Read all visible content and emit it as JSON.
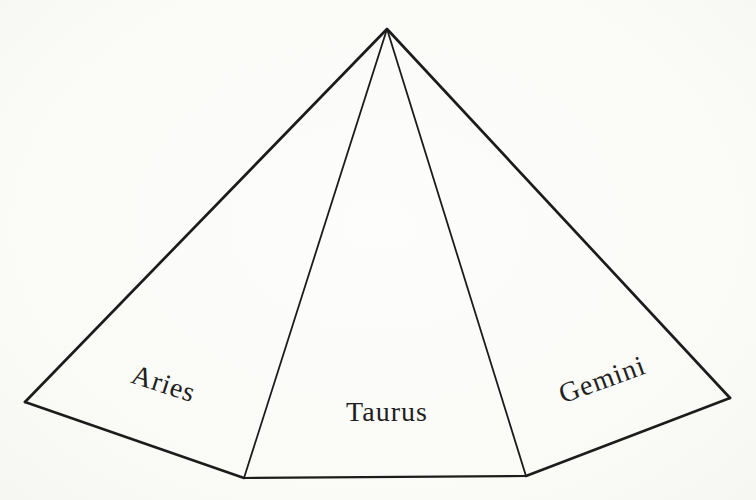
{
  "diagram": {
    "name": "Fan diagram of three zodiac panels radiating from a single apex",
    "segments": [
      {
        "id": "aries",
        "label": "Aries",
        "position": "left",
        "label_rotation_deg": 18
      },
      {
        "id": "taurus",
        "label": "Taurus",
        "position": "center",
        "label_rotation_deg": 0
      },
      {
        "id": "gemini",
        "label": "Gemini",
        "position": "right",
        "label_rotation_deg": -20
      }
    ],
    "geometry": {
      "apex": [
        387,
        29
      ],
      "left_outer_vertex": [
        25,
        402
      ],
      "aries_taurus_base_vertex": [
        244,
        478
      ],
      "taurus_gemini_base_vertex": [
        526,
        476
      ],
      "right_outer_vertex": [
        730,
        398
      ]
    }
  },
  "colors": {
    "line": "#1c1c1c",
    "text": "#1f1f1f",
    "background": "#fbfbf9"
  }
}
